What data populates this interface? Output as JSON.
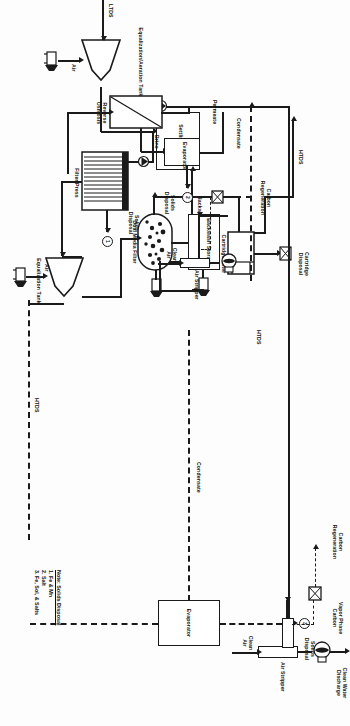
{
  "diagram": {
    "orientation": "landscape-rotated-90",
    "line_color": "#1a1a1a",
    "background": "#fdfdfd"
  },
  "notes": {
    "heading": "Note: Solids Disposal",
    "items": [
      "1. Fe & Mn",
      "2. Salt",
      "3. Fe, Sol, & Salts"
    ]
  },
  "streams": {
    "ltds": "LTDS",
    "htds_1": "HTDS",
    "htds_2": "HTDS",
    "htds_3": "HTDS",
    "air_1": "Air",
    "air_2": "Air",
    "clean_air_1": "Clean Air",
    "clean_air_2": "Clean Air",
    "backwash": "Backwash",
    "brine": "Brine",
    "permeate": "Permeate",
    "condensate_1": "Condensate",
    "condensate_2": "Condensate",
    "carbon_regeneration_1": "Carbon Regeneration",
    "carbon_regeneration_2": "Carbon Regeneration",
    "vapor_phase_carbon": "Vapor Phase Carbon",
    "clean_water_discharge": "Clean Water Discharge",
    "cartridge_disposal": "Cartridge Disposal",
    "solids_disposal_1": "Solids Disposal",
    "solids_disposal_2": "Solids Disposal"
  },
  "equipment": [
    {
      "id": "equalization-aeration-tank",
      "label": "Equalization/Aeration Tank"
    },
    {
      "id": "equalization-tank",
      "label": "Equalization Tank"
    },
    {
      "id": "settling-tank",
      "label": "Settling Tank"
    },
    {
      "id": "filter-press",
      "label": "Filter Press"
    },
    {
      "id": "dual-media-filter",
      "label": "Dual Media Filter"
    },
    {
      "id": "backwash-storage",
      "label": "Backwash Storage"
    },
    {
      "id": "cartridge-filter",
      "label": "Cartridge Filter"
    },
    {
      "id": "reverse-osmosis",
      "label": "Reverse Osmosis"
    },
    {
      "id": "evaporator-1",
      "label": "Evaporator"
    },
    {
      "id": "evaporator-2",
      "label": "Evaporator"
    },
    {
      "id": "air-stripper-1",
      "label": "Air Stripper"
    },
    {
      "id": "air-stripper-2",
      "label": "Air Stripper"
    }
  ],
  "note_markers": {
    "marker_1": "1",
    "marker_2": "2",
    "marker_3": "3"
  }
}
